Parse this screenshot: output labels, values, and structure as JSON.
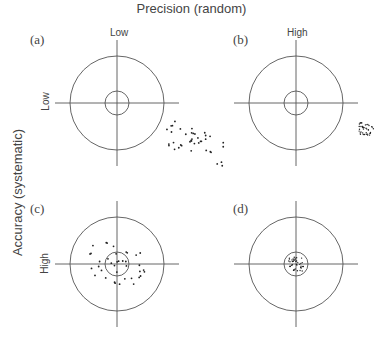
{
  "title": "Precision (random)",
  "y_axis_label": "Accuracy (systematic)",
  "columns": [
    {
      "label": "Low"
    },
    {
      "label": "High"
    }
  ],
  "rows": [
    {
      "label": "Low"
    },
    {
      "label": "High"
    }
  ],
  "panels": [
    {
      "id": "a",
      "label": "(a)",
      "precision": "Low",
      "accuracy": "Low",
      "description": "widely scattered points offset lower-right of target"
    },
    {
      "id": "b",
      "label": "(b)",
      "precision": "High",
      "accuracy": "Low",
      "description": "tight cluster offset lower-right of target"
    },
    {
      "id": "c",
      "label": "(c)",
      "precision": "Low",
      "accuracy": "High",
      "description": "widely scattered points centered on target"
    },
    {
      "id": "d",
      "label": "(d)",
      "precision": "High",
      "accuracy": "High",
      "description": "tight cluster within bullseye"
    }
  ],
  "colors": {
    "line": "#555555",
    "dot": "#222222",
    "text": "#444444"
  }
}
